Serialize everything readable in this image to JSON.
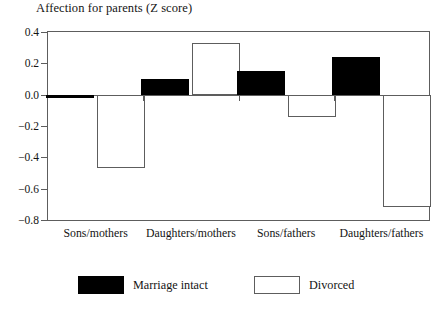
{
  "chart_data": {
    "type": "bar",
    "title": "Affection for parents (Z score)",
    "xlabel": "",
    "ylabel": "",
    "ylim": [
      -0.8,
      0.4
    ],
    "yticks": [
      0.4,
      0.2,
      0.0,
      -0.2,
      -0.4,
      -0.6,
      -0.8
    ],
    "ytick_labels": [
      "0.4",
      "0.2",
      "0.0",
      "−0.2",
      "−0.4",
      "−0.6",
      "−0.8"
    ],
    "grid": false,
    "legend_position": "below",
    "categories": [
      "Sons/mothers",
      "Daughters/mothers",
      "Sons/fathers",
      "Daughters/fathers"
    ],
    "series": [
      {
        "name": "Marriage intact",
        "color": "#000000",
        "values": [
          -0.02,
          0.1,
          0.15,
          0.24
        ]
      },
      {
        "name": "Divorced",
        "color": "#ffffff",
        "values": [
          -0.47,
          0.33,
          -0.14,
          -0.72
        ]
      }
    ]
  },
  "legend": {
    "entries": [
      {
        "label": "Marriage intact",
        "style": "intact"
      },
      {
        "label": "Divorced",
        "style": "divorced"
      }
    ]
  },
  "colors": {
    "intact": "#000000",
    "divorced": "#ffffff",
    "axis": "#5d5d5d",
    "text": "#141414",
    "background": "#ffffff"
  }
}
